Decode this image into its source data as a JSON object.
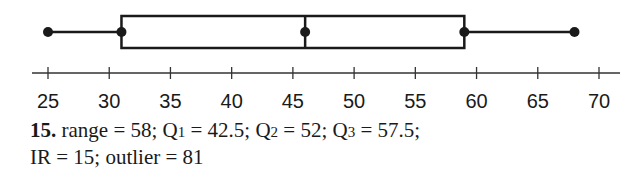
{
  "chart_data": {
    "type": "boxplot",
    "title": "",
    "xlabel": "",
    "ylabel": "",
    "axis": {
      "min": 25,
      "max": 70,
      "ticks": [
        25,
        30,
        35,
        40,
        45,
        50,
        55,
        60,
        65,
        70
      ],
      "tick_labels": [
        "25",
        "30",
        "35",
        "40",
        "45",
        "50",
        "55",
        "60",
        "65",
        "70"
      ]
    },
    "box": {
      "min": 25,
      "q1": 31,
      "median": 46,
      "q3": 59,
      "max": 68
    },
    "grid": false,
    "legend": null
  },
  "caption": {
    "number": "15.",
    "line1": {
      "range_text": " range = 58; Q",
      "q1_sub": "1",
      "q1_text": " = 42.5; Q",
      "q2_sub": "2",
      "q2_text": " = 52; Q",
      "q3_sub": "3",
      "q3_text": " = 57.5;"
    },
    "line2": "IR = 15; outlier = 81"
  }
}
